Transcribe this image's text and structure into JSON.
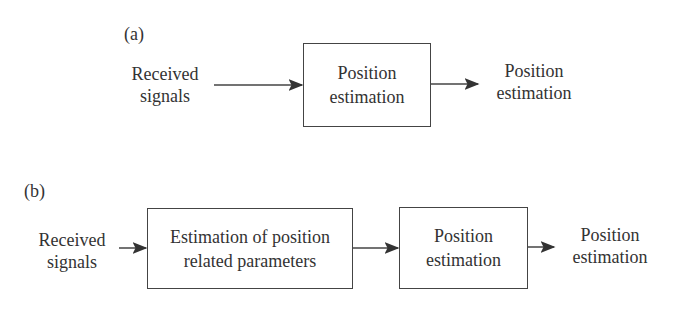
{
  "diagram_a": {
    "label": "(a)",
    "input": [
      "Received",
      "signals"
    ],
    "block": [
      "Position",
      "estimation"
    ],
    "output": [
      "Position",
      "estimation"
    ]
  },
  "diagram_b": {
    "label": "(b)",
    "input": [
      "Received",
      "signals"
    ],
    "block1": [
      "Estimation of position",
      "related parameters"
    ],
    "block2": [
      "Position",
      "estimation"
    ],
    "output": [
      "Position",
      "estimation"
    ]
  },
  "colors": {
    "stroke": "#444444",
    "text": "#333333"
  }
}
